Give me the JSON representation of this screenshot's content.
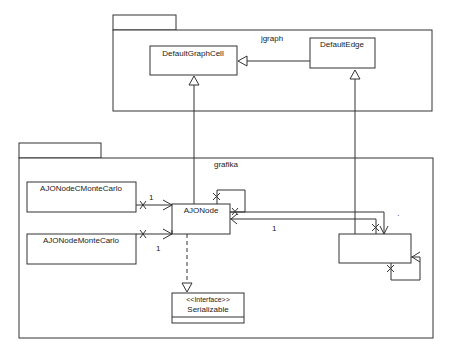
{
  "packages": [
    {
      "name": "jgraph"
    },
    {
      "name": "grafika"
    }
  ],
  "classes": {
    "default_graph_cell": "DefaultGraphCell",
    "default_edge": "DefaultEdge",
    "ajo_node_c_monte_carlo": "AJONodeCMonteCarlo",
    "ajo_node_monte_carlo": "AJONodeMonteCarlo",
    "ajo_node": "AJONode",
    "unnamed_edge_class": ""
  },
  "interface": {
    "stereotype": "<<Interface>>",
    "name": "Serializable"
  },
  "multiplicities": {
    "cmc_to_node": "1",
    "mc_to_node": "1",
    "node_to_edge": "1",
    "dot_marker": "·"
  }
}
